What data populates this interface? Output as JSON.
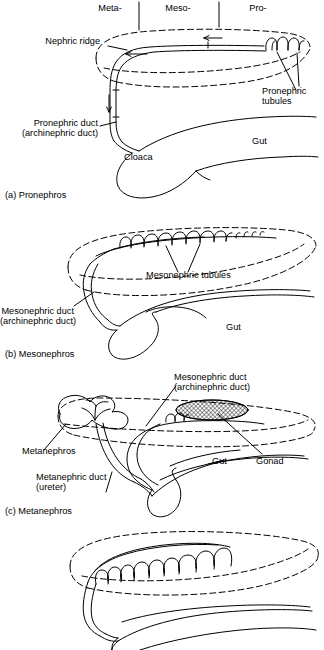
{
  "figure": {
    "title_region": {
      "regions": [
        {
          "label": "Meta-",
          "x": 110,
          "y": 4
        },
        {
          "label": "Meso-",
          "x": 178,
          "y": 4
        },
        {
          "label": "Pro-",
          "x": 256,
          "y": 4
        }
      ]
    },
    "panels": [
      {
        "id": "a",
        "caption": "(a) Pronephros",
        "labels": [
          {
            "name": "nephric-ridge",
            "text": "Nephric ridge"
          },
          {
            "name": "pronephric-tubules",
            "text": "Pronephric\ntubules"
          },
          {
            "name": "pronephric-duct",
            "text": "Pronephric duct\n(archinephric duct)"
          },
          {
            "name": "cloaca",
            "text": "Cloaca"
          },
          {
            "name": "gut",
            "text": "Gut"
          }
        ]
      },
      {
        "id": "b",
        "caption": "(b) Mesonephros",
        "labels": [
          {
            "name": "mesonephric-tubules",
            "text": "Mesonephric tubules"
          },
          {
            "name": "mesonephric-duct",
            "text": "Mesonephric duct\n(archinephric duct)"
          },
          {
            "name": "gut",
            "text": "Gut"
          }
        ]
      },
      {
        "id": "c",
        "caption": "(c) Metanephros",
        "labels": [
          {
            "name": "mesonephric-duct",
            "text": "Mesonephric duct\n(archinephric duct)"
          },
          {
            "name": "metanephros",
            "text": "Metanephros"
          },
          {
            "name": "metanephric-duct",
            "text": "Metanephric duct\n(ureter)"
          },
          {
            "name": "gut",
            "text": "Gut"
          },
          {
            "name": "gonad",
            "text": "Gonad"
          }
        ]
      },
      {
        "id": "d",
        "caption": "",
        "labels": []
      }
    ],
    "text": {
      "meta": "Meta-",
      "meso": "Meso-",
      "pro": "Pro-",
      "nephric_ridge": "Nephric ridge",
      "pronephric_tubules_l1": "Pronephric",
      "pronephric_tubules_l2": "tubules",
      "pronephric_duct_l1": "Pronephric duct",
      "pronephric_duct_l2": "(archinephric duct)",
      "cloaca": "Cloaca",
      "gut_a": "Gut",
      "caption_a": "(a) Pronephros",
      "mesonephric_tubules": "Mesonephric tubules",
      "mesonephric_duct_l1": "Mesonephric duct",
      "mesonephric_duct_l2": "(archinephric duct)",
      "gut_b": "Gut",
      "caption_b": "(b) Mesonephros",
      "meso_duct_c_l1": "Mesonephric duct",
      "meso_duct_c_l2": "(archinephric duct)",
      "metanephros": "Metanephros",
      "metanephric_duct_l1": "Metanephric duct",
      "metanephric_duct_l2": "(ureter)",
      "gut_c": "Gut",
      "gonad": "Gonad",
      "caption_c": "(c) Metanephros"
    },
    "colors": {
      "ink": "#000000",
      "background": "#ffffff",
      "hatch": "#000000"
    }
  }
}
